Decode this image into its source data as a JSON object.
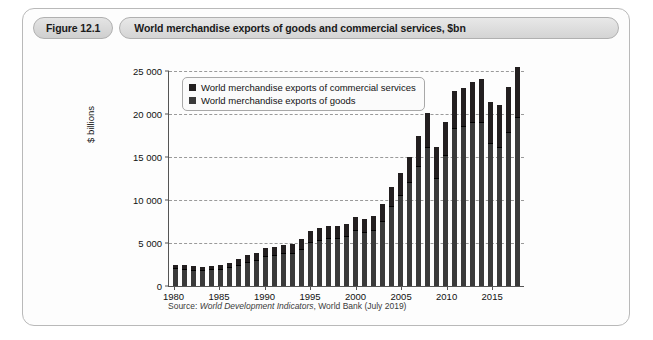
{
  "figure": {
    "badge": "Figure 12.1",
    "title": "World merchandise exports of goods and commercial services, $bn",
    "source_prefix": "Source:",
    "source_italic": "World Development Indicators",
    "source_suffix": ", World Bank (July 2019)"
  },
  "colors": {
    "services": "#231f20",
    "goods": "#3a3a3a",
    "axis": "#555555",
    "grid": "#9a9a9a",
    "card_border": "#b9b9b9",
    "header_fill": "#dcdcdc"
  },
  "legend": {
    "items": [
      {
        "label": "World merchandise exports of commercial services",
        "color": "#231f20"
      },
      {
        "label": "World merchandise exports of goods",
        "color": "#3a3a3a"
      }
    ]
  },
  "chart_data": {
    "type": "bar",
    "stacked": true,
    "title": "World merchandise exports of goods and commercial services, $bn",
    "xlabel": "",
    "ylabel": "$ billions",
    "ylim": [
      0,
      25000
    ],
    "yticks": [
      0,
      5000,
      10000,
      15000,
      20000,
      25000
    ],
    "ytick_labels": [
      "0",
      "5 000",
      "10 000",
      "15 000",
      "20 000",
      "25 000"
    ],
    "xticks": [
      1980,
      1985,
      1990,
      1995,
      2000,
      2005,
      2010,
      2015
    ],
    "grid": true,
    "legend_position": "upper left",
    "categories": [
      1980,
      1981,
      1982,
      1983,
      1984,
      1985,
      1986,
      1987,
      1988,
      1989,
      1990,
      1991,
      1992,
      1993,
      1994,
      1995,
      1996,
      1997,
      1998,
      1999,
      2000,
      2001,
      2002,
      2003,
      2004,
      2005,
      2006,
      2007,
      2008,
      2009,
      2010,
      2011,
      2012,
      2013,
      2014,
      2015,
      2016,
      2017,
      2018
    ],
    "series": [
      {
        "name": "World merchandise exports of goods",
        "values": [
          1930,
          1900,
          1780,
          1750,
          1830,
          1840,
          2050,
          2380,
          2730,
          2960,
          3410,
          3480,
          3710,
          3720,
          4230,
          5050,
          5260,
          5490,
          5420,
          5650,
          6380,
          6110,
          6430,
          7500,
          9150,
          10420,
          12030,
          13870,
          16050,
          12500,
          15150,
          18280,
          18500,
          18950,
          19000,
          16500,
          16100,
          17750,
          19500
        ]
      },
      {
        "name": "World merchandise exports of commercial services",
        "values": [
          400,
          420,
          400,
          390,
          420,
          450,
          540,
          650,
          740,
          790,
          880,
          900,
          1000,
          1000,
          1100,
          1250,
          1340,
          1390,
          1420,
          1460,
          1520,
          1520,
          1640,
          1900,
          2260,
          2560,
          2900,
          3440,
          3950,
          3500,
          3750,
          4240,
          4420,
          4700,
          5000,
          4800,
          4850,
          5300,
          5800
        ]
      }
    ],
    "totals": [
      2330,
      2320,
      2180,
      2140,
      2250,
      2290,
      2590,
      3030,
      3470,
      3750,
      4290,
      4380,
      4710,
      4720,
      5330,
      6300,
      6600,
      6880,
      6840,
      7110,
      7900,
      7630,
      8070,
      9400,
      11410,
      12980,
      14930,
      17310,
      20000,
      16000,
      18900,
      22520,
      22920,
      23650,
      24000,
      21300,
      20950,
      23050,
      25300
    ]
  }
}
